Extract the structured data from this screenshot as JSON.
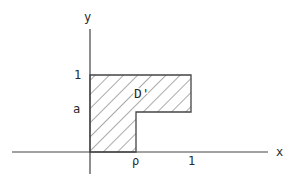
{
  "diagram": {
    "axes": {
      "x_label": "x",
      "y_label": "y"
    },
    "tick_labels": {
      "x_rho": "ρ",
      "x_one": "1",
      "y_one": "1",
      "y_a": "a"
    },
    "region": {
      "label": "D'",
      "shape": "L-shaped hatched region bounded by x=0, y=1, x=1, y=a, x=ρ, y=0",
      "fill": "hatched"
    },
    "colors": {
      "line": "#444444",
      "text": "#2a2a2a",
      "background": "#ffffff"
    }
  }
}
